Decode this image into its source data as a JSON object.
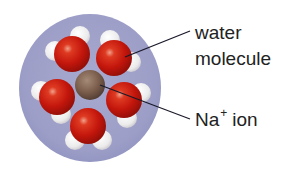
{
  "diagram": {
    "labels": {
      "water_line1": "water",
      "water_line2": "molecule",
      "ion_main": "Na",
      "ion_charge": "+",
      "ion_suffix": "ion"
    },
    "colors": {
      "shell": "#9ea0c8",
      "oxygen": "#c8170f",
      "hydrogen": "#f2f0f0",
      "sodium": "#7a5a48",
      "leader_line": "#1a1a2a",
      "text": "#222222"
    },
    "components": {
      "central_ion": "Na+",
      "water_molecule_count": 6
    }
  }
}
